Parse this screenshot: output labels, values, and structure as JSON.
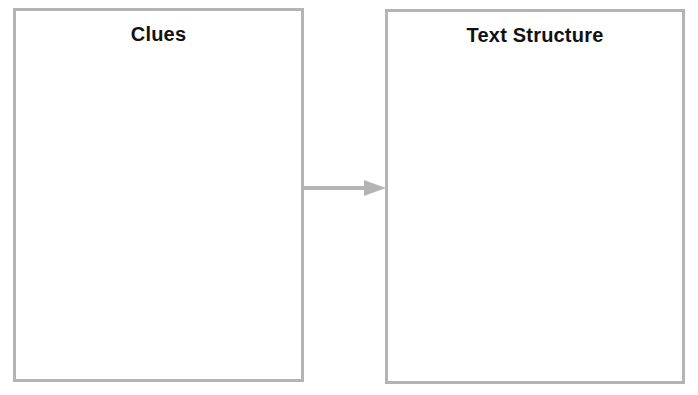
{
  "diagram": {
    "boxes": [
      {
        "title": "Clues",
        "content": ""
      },
      {
        "title": "Text Structure",
        "content": ""
      }
    ],
    "connector": {
      "from": "Clues",
      "to": "Text Structure",
      "type": "arrow",
      "color": "#b4b4b4"
    },
    "border_color": "#b4b4b4"
  }
}
